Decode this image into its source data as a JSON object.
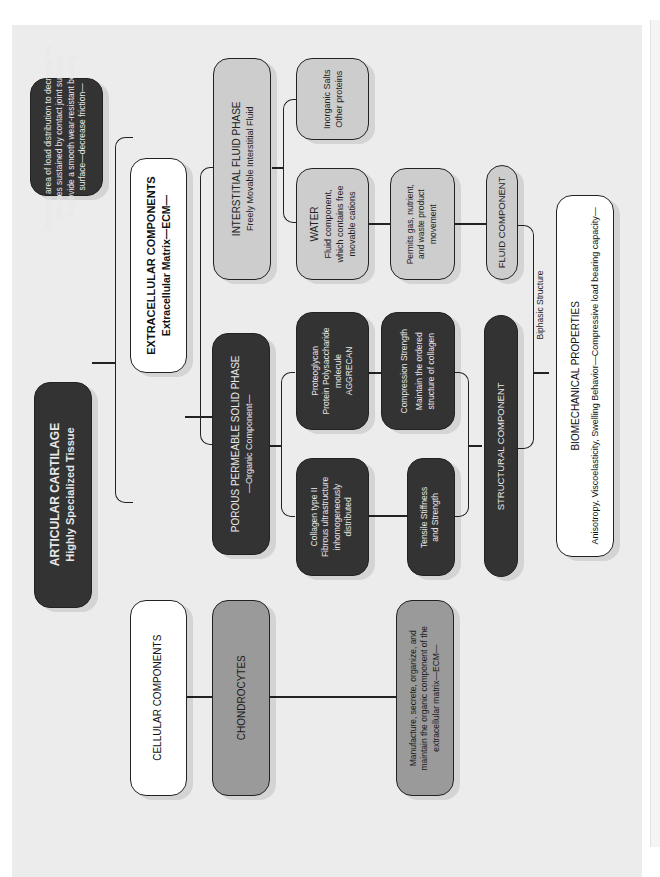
{
  "diagram": {
    "root": {
      "title": "ARTICULAR CARTILAGE",
      "subtitle": "Highly Specialized Tissue"
    },
    "function": {
      "lines": [
        "Increase area of load distribution to decrease the",
        "stresses sustained by contact joint surfaces",
        "To provide a smooth wear-resistant bearing",
        "surface—decrease friction—"
      ]
    },
    "extracellular": {
      "title": "EXTRACELLULAR COMPONENTS",
      "subtitle": "Extracellular Matrix—ECM—"
    },
    "cellular": {
      "title": "CELLULAR COMPONENTS"
    },
    "chondrocytes": {
      "title": "CHONDROCYTES"
    },
    "chondrocyte_role": {
      "lines": [
        "Manufacture, secrete, organize, and",
        "maintain the organic component of the",
        "extracellular matrix—ECM—"
      ]
    },
    "fluid_phase": {
      "title": "INTERSTITIAL FLUID PHASE",
      "subtitle": "Freely Movable Interstitial Fluid"
    },
    "solid_phase": {
      "title": "POROUS PERMEABLE SOLID PHASE",
      "subtitle": "—Organic Component—"
    },
    "inorganic": {
      "lines": [
        "Inorganic Salts",
        "Other proteins"
      ]
    },
    "water": {
      "title": "WATER",
      "lines": [
        "Fluid component,",
        "which contains free",
        "movable cations"
      ]
    },
    "permits": {
      "lines": [
        "Permits gas, nutrient,",
        "and waste product",
        "movement"
      ]
    },
    "fluid_component": {
      "title": "FLUID COMPONENT"
    },
    "proteoglycan": {
      "lines": [
        "Proteoglycan",
        "Protein Polysaccharide",
        "molecule",
        "AGGRECAN"
      ]
    },
    "compression": {
      "title": "Compression Strength",
      "lines": [
        "Maintain the ordered",
        "structure of collagen"
      ]
    },
    "collagen": {
      "lines": [
        "Collagen type II",
        "Fibrous ultrastructure",
        "inhomogeneously",
        "distributed"
      ]
    },
    "tensile": {
      "lines": [
        "Tensile Stiffness",
        "and Strength"
      ]
    },
    "structural": {
      "title": "STRUCTURAL COMPONENT"
    },
    "biphasic_label": "Biphasic Structure",
    "biomech": {
      "title": "BIOMECHANICAL PROPERTIES",
      "subtitle": "Anisotropy, Viscoelasticity, Swelling Behavior—Compressive load bearing capacity—"
    }
  }
}
